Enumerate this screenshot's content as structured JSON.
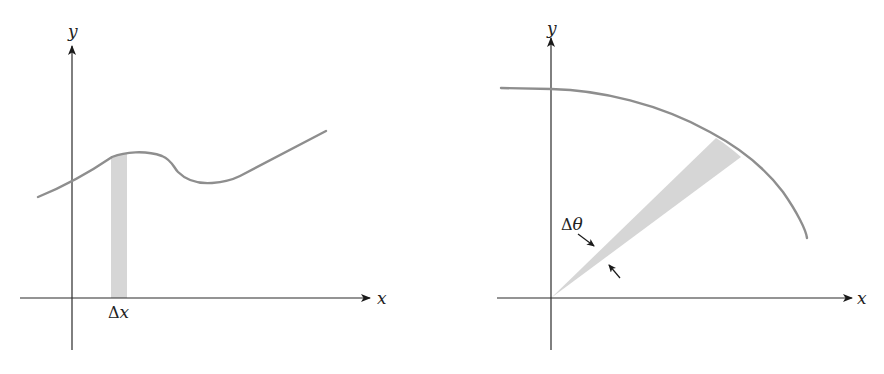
{
  "figure": {
    "panels": [
      {
        "id": "cartesian-area",
        "axes": {
          "x_label": "x",
          "y_label": "y"
        },
        "strip_label_delta": "Δ",
        "strip_label_var": "x",
        "description": "Curve y=f(x) with a thin vertical rectangle of width Δx"
      },
      {
        "id": "polar-area",
        "axes": {
          "x_label": "x",
          "y_label": "y"
        },
        "wedge_label_delta": "Δ",
        "wedge_label_var": "θ",
        "description": "Polar curve with a thin sector of angle Δθ from the origin"
      }
    ],
    "colors": {
      "axis": "#2a2a2a",
      "curve": "#8e8e8e",
      "shade": "#d6d6d6",
      "background": "#ffffff"
    }
  }
}
